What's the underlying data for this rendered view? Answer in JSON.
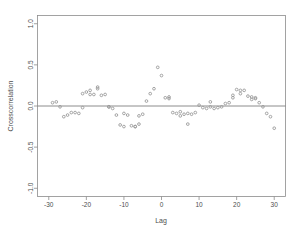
{
  "chart_data": {
    "type": "scatter",
    "title": "",
    "xlabel": "Lag",
    "ylabel": "Crosscorrelation",
    "xlim": [
      -33,
      33
    ],
    "ylim": [
      -1.1,
      1.1
    ],
    "grid": false,
    "legend": null,
    "reference_lines": [
      {
        "orientation": "horizontal",
        "value": 0.0
      }
    ],
    "xticks": [
      -30,
      -20,
      -10,
      0,
      10,
      20,
      30
    ],
    "xtick_labels": [
      "-30",
      "-20",
      "-10",
      "0",
      "10",
      "20",
      "30"
    ],
    "yticks": [
      -1.0,
      -0.5,
      0.0,
      0.5,
      1.0
    ],
    "ytick_labels": [
      "-1.0",
      "-0.5",
      "0.0",
      "0.5",
      "1.0"
    ],
    "marker": "open-circle",
    "marker_color": "#9a9a9a",
    "points": [
      {
        "x": -29,
        "y": 0.04
      },
      {
        "x": -28,
        "y": 0.05
      },
      {
        "x": -27,
        "y": -0.01
      },
      {
        "x": -26,
        "y": -0.13
      },
      {
        "x": -25,
        "y": -0.11
      },
      {
        "x": -24,
        "y": -0.08
      },
      {
        "x": -23,
        "y": -0.08
      },
      {
        "x": -22,
        "y": -0.09
      },
      {
        "x": -21,
        "y": -0.02
      },
      {
        "x": -21,
        "y": 0.15
      },
      {
        "x": -20,
        "y": 0.17
      },
      {
        "x": -19,
        "y": 0.19
      },
      {
        "x": -19,
        "y": 0.14
      },
      {
        "x": -18,
        "y": 0.14
      },
      {
        "x": -17,
        "y": 0.21
      },
      {
        "x": -17,
        "y": 0.23
      },
      {
        "x": -16,
        "y": 0.13
      },
      {
        "x": -15,
        "y": 0.14
      },
      {
        "x": -14,
        "y": -0.01
      },
      {
        "x": -14,
        "y": -0.01
      },
      {
        "x": -13,
        "y": -0.03
      },
      {
        "x": -12,
        "y": -0.11
      },
      {
        "x": -11,
        "y": -0.23
      },
      {
        "x": -10,
        "y": -0.25
      },
      {
        "x": -10,
        "y": -0.09
      },
      {
        "x": -9,
        "y": -0.11
      },
      {
        "x": -8,
        "y": -0.24
      },
      {
        "x": -7,
        "y": -0.25
      },
      {
        "x": -7,
        "y": -0.25
      },
      {
        "x": -6,
        "y": -0.22
      },
      {
        "x": -6,
        "y": -0.12
      },
      {
        "x": -5,
        "y": -0.1
      },
      {
        "x": -4,
        "y": 0.06
      },
      {
        "x": -3,
        "y": 0.15
      },
      {
        "x": -2,
        "y": 0.21
      },
      {
        "x": -1,
        "y": 0.47
      },
      {
        "x": 0,
        "y": 0.37
      },
      {
        "x": 1,
        "y": 0.1
      },
      {
        "x": 2,
        "y": 0.11
      },
      {
        "x": 2,
        "y": 0.09
      },
      {
        "x": 3,
        "y": -0.08
      },
      {
        "x": 4,
        "y": -0.09
      },
      {
        "x": 5,
        "y": -0.12
      },
      {
        "x": 5,
        "y": -0.07
      },
      {
        "x": 6,
        "y": -0.1
      },
      {
        "x": 7,
        "y": -0.22
      },
      {
        "x": 7,
        "y": -0.09
      },
      {
        "x": 8,
        "y": -0.1
      },
      {
        "x": 9,
        "y": -0.08
      },
      {
        "x": 10,
        "y": 0.01
      },
      {
        "x": 11,
        "y": -0.02
      },
      {
        "x": 12,
        "y": -0.03
      },
      {
        "x": 13,
        "y": -0.01
      },
      {
        "x": 13,
        "y": 0.05
      },
      {
        "x": 14,
        "y": -0.03
      },
      {
        "x": 15,
        "y": -0.02
      },
      {
        "x": 16,
        "y": -0.01
      },
      {
        "x": 17,
        "y": 0.03
      },
      {
        "x": 18,
        "y": 0.04
      },
      {
        "x": 19,
        "y": 0.1
      },
      {
        "x": 19,
        "y": 0.13
      },
      {
        "x": 20,
        "y": 0.2
      },
      {
        "x": 21,
        "y": 0.15
      },
      {
        "x": 21,
        "y": 0.19
      },
      {
        "x": 22,
        "y": 0.19
      },
      {
        "x": 23,
        "y": 0.12
      },
      {
        "x": 24,
        "y": 0.08
      },
      {
        "x": 24,
        "y": 0.11
      },
      {
        "x": 25,
        "y": 0.09
      },
      {
        "x": 25,
        "y": 0.1
      },
      {
        "x": 26,
        "y": 0.04
      },
      {
        "x": 27,
        "y": -0.01
      },
      {
        "x": 28,
        "y": -0.09
      },
      {
        "x": 29,
        "y": -0.13
      },
      {
        "x": 30,
        "y": -0.27
      }
    ]
  },
  "axes": {
    "x_title": "Lag",
    "y_title": "Crosscorrelation"
  }
}
